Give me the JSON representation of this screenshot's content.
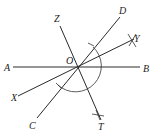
{
  "diagram": {
    "type": "geometric construction",
    "center": {
      "label": "O"
    },
    "lines": [
      {
        "name": "AB",
        "from": "A",
        "to": "B"
      },
      {
        "name": "CD",
        "from": "C",
        "to": "D"
      },
      {
        "name": "XY",
        "from": "X",
        "to": "Y"
      },
      {
        "name": "ZT",
        "from": "Z",
        "to": "T"
      }
    ],
    "labels": {
      "A": "A",
      "B": "B",
      "C": "C",
      "D": "D",
      "O": "O",
      "X": "X",
      "Y": "Y",
      "Z": "Z",
      "T": "T"
    },
    "construction_marks": [
      "arc centered at O",
      "arc ticks on OD and OC",
      "cross marks at Y and T"
    ]
  }
}
